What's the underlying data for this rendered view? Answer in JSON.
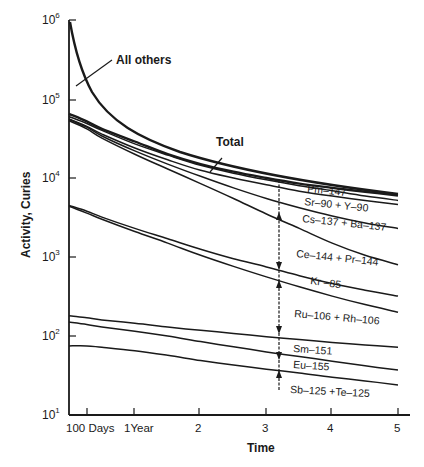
{
  "chart_data": {
    "type": "line",
    "title": "",
    "xlabel": "Time",
    "ylabel": "Activity, Curies",
    "yscale": "log",
    "ylim": [
      10,
      1000000
    ],
    "xlim_years": [
      0,
      5
    ],
    "grid": false,
    "legend": "inline labels",
    "yticks": [
      {
        "base": "10",
        "exp": "1",
        "value": 10
      },
      {
        "base": "10",
        "exp": "2",
        "value": 100
      },
      {
        "base": "10",
        "exp": "3",
        "value": 1000
      },
      {
        "base": "10",
        "exp": "4",
        "value": 10000
      },
      {
        "base": "10",
        "exp": "5",
        "value": 100000
      },
      {
        "base": "10",
        "exp": "6",
        "value": 1000000
      }
    ],
    "xticks": [
      {
        "label": "100 Days",
        "years": 0.27
      },
      {
        "label": "1Year",
        "years": 1
      },
      {
        "label": "2",
        "years": 2
      },
      {
        "label": "3",
        "years": 3
      },
      {
        "label": "4",
        "years": 4
      },
      {
        "label": "5",
        "years": 5
      }
    ],
    "x": [
      0.0,
      0.27,
      0.5,
      1.0,
      1.5,
      2.0,
      2.5,
      3.0,
      3.5,
      4.0,
      4.5,
      5.0
    ],
    "series": [
      {
        "name": "All others",
        "bold": true,
        "values": [
          800000,
          200000,
          100000,
          45000,
          25000,
          null,
          null,
          null,
          null,
          null,
          null,
          null
        ]
      },
      {
        "name": "Total",
        "bold": true,
        "values": [
          65000,
          52000,
          42000,
          29000,
          20000,
          15000,
          12000,
          10000,
          8500,
          7500,
          6700,
          6000
        ]
      },
      {
        "name": "Pm-147",
        "bold": false,
        "values": [
          60000,
          49000,
          40000,
          27000,
          19500,
          14500,
          11500,
          9500,
          8000,
          6900,
          5900,
          5200
        ]
      },
      {
        "name": "Sr-90 + Y-90",
        "bold": false,
        "values": [
          56000,
          45000,
          36000,
          24000,
          17000,
          12500,
          10000,
          8200,
          6800,
          5900,
          5200,
          4600
        ]
      },
      {
        "name": "Cs-137 + Ba-137",
        "bold": false,
        "values": [
          55000,
          44000,
          34000,
          22000,
          15000,
          10500,
          7500,
          5500,
          4200,
          3300,
          2700,
          2300
        ]
      },
      {
        "name": "Ce-144 + Pr-144",
        "bold": false,
        "values": [
          53000,
          42000,
          32000,
          20000,
          13000,
          8500,
          5500,
          3500,
          2300,
          1500,
          1050,
          800
        ]
      },
      {
        "name": "Kr-85",
        "bold": false,
        "values": [
          4500,
          3800,
          3200,
          2300,
          1700,
          1250,
          950,
          750,
          580,
          460,
          380,
          320
        ]
      },
      {
        "name": "Ru-106 + Rh-106",
        "bold": false,
        "values": [
          4400,
          3600,
          3000,
          2100,
          1500,
          1050,
          760,
          560,
          420,
          320,
          250,
          200
        ]
      },
      {
        "name": "Sm-151",
        "bold": false,
        "values": [
          180,
          170,
          160,
          145,
          130,
          118,
          108,
          98,
          90,
          83,
          77,
          72
        ]
      },
      {
        "name": "Eu-155",
        "bold": false,
        "values": [
          150,
          140,
          130,
          115,
          100,
          85,
          73,
          63,
          55,
          48,
          42,
          37
        ]
      },
      {
        "name": "Sb-125 + Te-125",
        "bold": false,
        "values": [
          75,
          75,
          72,
          65,
          57,
          49,
          43,
          38,
          34,
          30,
          27,
          24
        ]
      }
    ],
    "annotations": [
      {
        "text": "All others",
        "type": "leader-label"
      },
      {
        "text": "Total",
        "type": "leader-label"
      },
      {
        "text": "vertical double-headed arrows at ~3.2 years indicating contribution of each nuclide",
        "type": "arrows"
      }
    ]
  },
  "labels": {
    "all_others": "All others",
    "total": "Total",
    "pm147": "Pm–147",
    "sr90": "Sr–90 + Y–90",
    "cs137": "Cs–137 + Ba–137",
    "ce144": "Ce–144 + Pr–144",
    "kr85": "Kr –85",
    "ru106": "Ru–106 + Rh–106",
    "sm151": "Sm–151",
    "eu155": "Eu–155",
    "sb125": "Sb–125 +Te–125",
    "xlabel": "Time",
    "ylabel": "Activity, Curies",
    "x100days": "100 Days",
    "x1year": "1Year",
    "x2": "2",
    "x3": "3",
    "x4": "4",
    "x5": "5",
    "ybase": "10",
    "y1": "1",
    "y2": "2",
    "y3": "3",
    "y4": "4",
    "y5": "5",
    "y6": "6"
  }
}
